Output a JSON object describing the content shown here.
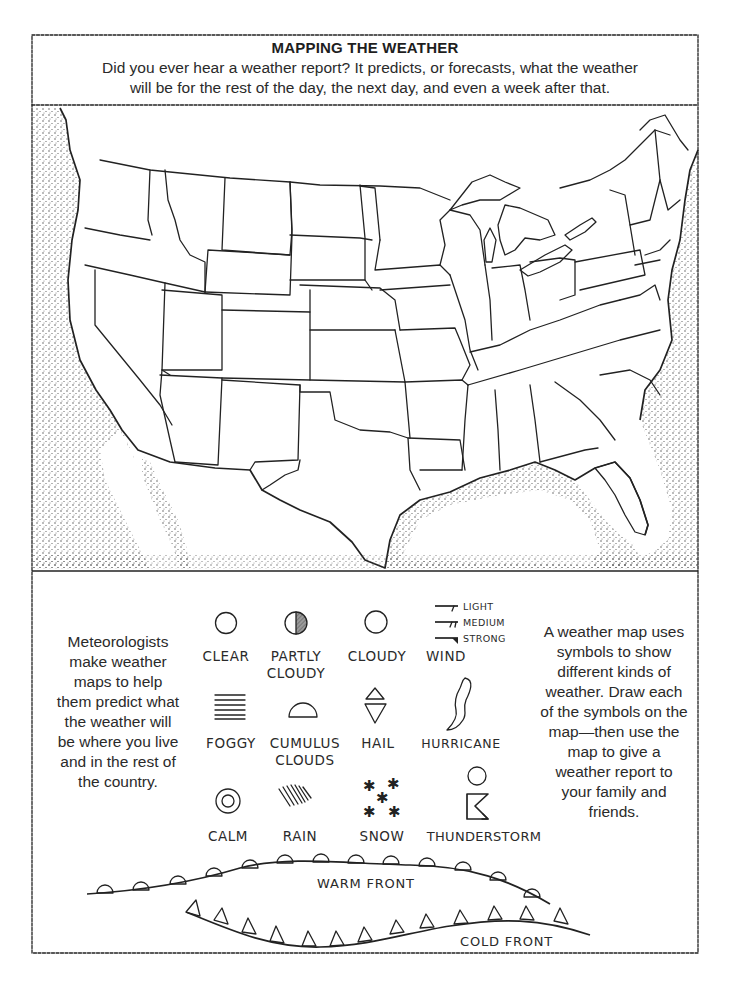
{
  "header": {
    "title": "MAPPING THE WEATHER",
    "intro_line1": "Did you ever hear a weather report? It predicts, or forecasts, what the weather",
    "intro_line2": "will be for the rest of the day, the next day, and even a week after that."
  },
  "map": {
    "subject": "United States outline map with state borders",
    "water_fill": "stippled"
  },
  "left_text": {
    "lines": [
      "Meteorologists",
      "make weather",
      "maps to help",
      "them predict what",
      "the weather will",
      "be where you live",
      "and in the rest of",
      "the country."
    ]
  },
  "right_text": {
    "lines": [
      "A weather map uses",
      "symbols to show",
      "different kinds of",
      "weather. Draw each",
      "of the symbols on the",
      "map—then use the",
      "map to give a",
      "weather report to",
      "your family and",
      "friends."
    ]
  },
  "legend": {
    "symbols": [
      {
        "id": "clear",
        "label1": "CLEAR",
        "label2": ""
      },
      {
        "id": "partly-cloudy",
        "label1": "PARTLY",
        "label2": "CLOUDY"
      },
      {
        "id": "cloudy",
        "label1": "CLOUDY",
        "label2": ""
      },
      {
        "id": "wind",
        "label1": "WIND",
        "label2": ""
      },
      {
        "id": "foggy",
        "label1": "FOGGY",
        "label2": ""
      },
      {
        "id": "cumulus-clouds",
        "label1": "CUMULUS",
        "label2": "CLOUDS"
      },
      {
        "id": "hail",
        "label1": "HAIL",
        "label2": ""
      },
      {
        "id": "hurricane",
        "label1": "HURRICANE",
        "label2": ""
      },
      {
        "id": "calm",
        "label1": "CALM",
        "label2": ""
      },
      {
        "id": "rain",
        "label1": "RAIN",
        "label2": ""
      },
      {
        "id": "snow",
        "label1": "SNOW",
        "label2": ""
      },
      {
        "id": "thunderstorm",
        "label1": "THUNDERSTORM",
        "label2": ""
      }
    ],
    "wind_strengths": [
      "LIGHT",
      "MEDIUM",
      "STRONG"
    ]
  },
  "fronts": {
    "warm_label": "WARM FRONT",
    "cold_label": "COLD FRONT"
  },
  "colors": {
    "ink": "#222222",
    "paper": "#ffffff",
    "shade": "#8a8a8a"
  }
}
